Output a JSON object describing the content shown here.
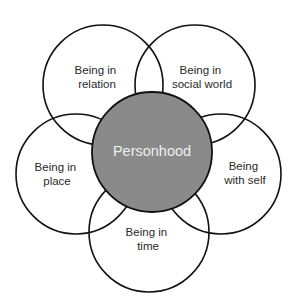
{
  "diagram": {
    "title": "Personhood",
    "colors": {
      "background": "#ffffff",
      "stroke": "#111111",
      "core_fill": "#8a8a8a",
      "core_text": "#efefef",
      "label_text": "#2a2a2a"
    },
    "core": {
      "label": "Personhood",
      "cx": 152,
      "cy": 152,
      "r": 60
    },
    "petals": [
      {
        "id": "relation",
        "line1": "Being in",
        "line2": "relation",
        "cx": 103,
        "cy": 85,
        "r": 60,
        "label_x": 97,
        "label_y1": 74,
        "label_y2": 88
      },
      {
        "id": "social-world",
        "line1": "Being in",
        "line2": "social world",
        "cx": 195,
        "cy": 85,
        "r": 60,
        "label_x": 202,
        "label_y1": 74,
        "label_y2": 88
      },
      {
        "id": "place",
        "line1": "Being in",
        "line2": "place",
        "cx": 76,
        "cy": 174,
        "r": 60,
        "label_x": 57,
        "label_y1": 171,
        "label_y2": 185
      },
      {
        "id": "self",
        "line1": "Being",
        "line2": "with self",
        "cx": 221,
        "cy": 174,
        "r": 60,
        "label_x": 245,
        "label_y1": 170,
        "label_y2": 184
      },
      {
        "id": "time",
        "line1": "Being in",
        "line2": "time",
        "cx": 149,
        "cy": 232,
        "r": 60,
        "label_x": 148,
        "label_y1": 236,
        "label_y2": 250
      }
    ]
  }
}
